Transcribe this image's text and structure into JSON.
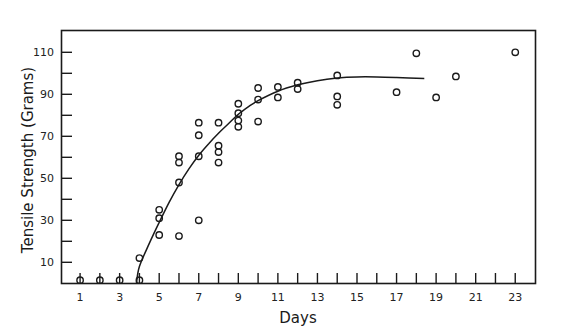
{
  "chart_data": {
    "type": "scatter",
    "title": "",
    "xlabel": "Days",
    "ylabel": "Tensile Strength (Grams)",
    "xlim": [
      0,
      24
    ],
    "ylim": [
      0,
      120
    ],
    "x_ticks": [
      1,
      2,
      3,
      4,
      5,
      6,
      7,
      8,
      9,
      10,
      11,
      12,
      13,
      14,
      15,
      16,
      17,
      18,
      19,
      20,
      21,
      22,
      23
    ],
    "x_tick_labels": [
      "1",
      "3",
      "5",
      "7",
      "9",
      "11",
      "13",
      "15",
      "17",
      "19",
      "21",
      "23"
    ],
    "x_tick_label_values": [
      1,
      3,
      5,
      7,
      9,
      11,
      13,
      15,
      17,
      19,
      21,
      23
    ],
    "y_ticks": [
      10,
      20,
      30,
      40,
      50,
      60,
      70,
      80,
      90,
      100,
      110
    ],
    "y_tick_labels": [
      "10",
      "30",
      "50",
      "70",
      "90",
      "110"
    ],
    "y_tick_label_values": [
      10,
      30,
      50,
      70,
      90,
      110
    ],
    "grid": false,
    "legend": null,
    "series": [
      {
        "name": "Observed",
        "kind": "scatter",
        "marker": "open-circle",
        "points": [
          {
            "x": 1,
            "y": 1.5
          },
          {
            "x": 2,
            "y": 1.5
          },
          {
            "x": 3,
            "y": 1.5
          },
          {
            "x": 4,
            "y": 1.5
          },
          {
            "x": 4,
            "y": 12
          },
          {
            "x": 5,
            "y": 23
          },
          {
            "x": 5,
            "y": 31
          },
          {
            "x": 5,
            "y": 35
          },
          {
            "x": 6,
            "y": 22.5
          },
          {
            "x": 6,
            "y": 48
          },
          {
            "x": 6,
            "y": 57.5
          },
          {
            "x": 6,
            "y": 60.5
          },
          {
            "x": 7,
            "y": 30
          },
          {
            "x": 7,
            "y": 60.5
          },
          {
            "x": 7,
            "y": 70.5
          },
          {
            "x": 7,
            "y": 76.5
          },
          {
            "x": 8,
            "y": 57.5
          },
          {
            "x": 8,
            "y": 62.5
          },
          {
            "x": 8,
            "y": 65.5
          },
          {
            "x": 8,
            "y": 76.5
          },
          {
            "x": 9,
            "y": 74.5
          },
          {
            "x": 9,
            "y": 77.5
          },
          {
            "x": 9,
            "y": 81
          },
          {
            "x": 9,
            "y": 85.5
          },
          {
            "x": 10,
            "y": 77
          },
          {
            "x": 10,
            "y": 87.5
          },
          {
            "x": 10,
            "y": 93
          },
          {
            "x": 11,
            "y": 88.5
          },
          {
            "x": 11,
            "y": 93.5
          },
          {
            "x": 12,
            "y": 92.5
          },
          {
            "x": 12,
            "y": 95.5
          },
          {
            "x": 14,
            "y": 85
          },
          {
            "x": 14,
            "y": 89
          },
          {
            "x": 14,
            "y": 99
          },
          {
            "x": 17,
            "y": 91
          },
          {
            "x": 18,
            "y": 109.5
          },
          {
            "x": 19,
            "y": 88.5
          },
          {
            "x": 20,
            "y": 98.5
          },
          {
            "x": 23,
            "y": 110
          }
        ]
      },
      {
        "name": "Fitted curve",
        "kind": "line",
        "points": [
          {
            "x": 3.85,
            "y": 0
          },
          {
            "x": 4,
            "y": 8
          },
          {
            "x": 4.5,
            "y": 19
          },
          {
            "x": 5,
            "y": 29
          },
          {
            "x": 5.5,
            "y": 38.5
          },
          {
            "x": 6,
            "y": 47
          },
          {
            "x": 6.5,
            "y": 54.5
          },
          {
            "x": 7,
            "y": 61
          },
          {
            "x": 7.5,
            "y": 66.5
          },
          {
            "x": 8,
            "y": 71.5
          },
          {
            "x": 8.5,
            "y": 76
          },
          {
            "x": 9,
            "y": 80.5
          },
          {
            "x": 9.5,
            "y": 84
          },
          {
            "x": 10,
            "y": 87
          },
          {
            "x": 11,
            "y": 91.5
          },
          {
            "x": 12,
            "y": 94.5
          },
          {
            "x": 13,
            "y": 96.5
          },
          {
            "x": 14,
            "y": 97.8
          },
          {
            "x": 15,
            "y": 98.3
          },
          {
            "x": 16,
            "y": 98.3
          },
          {
            "x": 17,
            "y": 98
          },
          {
            "x": 18.4,
            "y": 97.5
          }
        ]
      }
    ]
  },
  "axes": {
    "xlabel": "Days",
    "ylabel": "Tensile Strength (Grams)"
  }
}
